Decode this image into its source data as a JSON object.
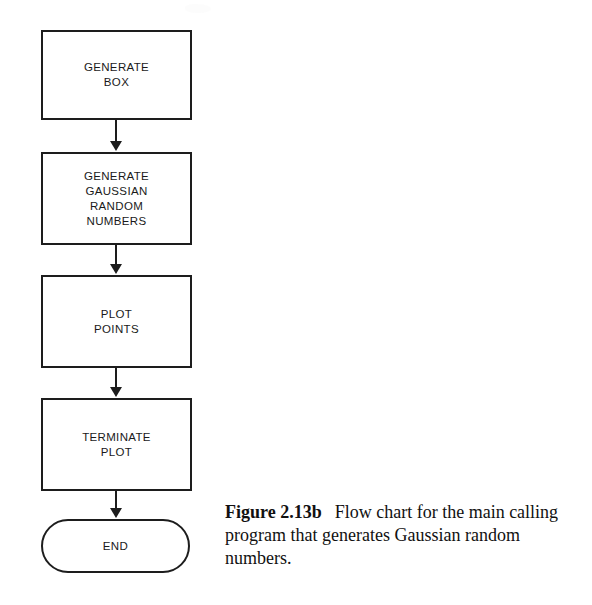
{
  "figure": {
    "caption_label": "Figure 2.13b",
    "caption_text": "Flow chart for the main calling program that generates Gaussian random numbers."
  },
  "flowchart": {
    "type": "flowchart",
    "orientation": "top-to-bottom",
    "nodes": [
      {
        "id": "generate-box",
        "shape": "process",
        "label": "GENERATE\nBOX"
      },
      {
        "id": "generate-gaussian",
        "shape": "process",
        "label": "GENERATE\nGAUSSIAN\nRANDOM\nNUMBERS"
      },
      {
        "id": "plot-points",
        "shape": "process",
        "label": "PLOT\nPOINTS"
      },
      {
        "id": "terminate-plot",
        "shape": "process",
        "label": "TERMINATE\nPLOT"
      },
      {
        "id": "end",
        "shape": "terminator",
        "label": "END"
      }
    ],
    "edges": [
      {
        "from": "generate-box",
        "to": "generate-gaussian",
        "arrow": "down"
      },
      {
        "from": "generate-gaussian",
        "to": "plot-points",
        "arrow": "down"
      },
      {
        "from": "plot-points",
        "to": "terminate-plot",
        "arrow": "down"
      },
      {
        "from": "terminate-plot",
        "to": "end",
        "arrow": "down"
      }
    ]
  },
  "style": {
    "background": "#ffffff",
    "stroke": "#1d1d1d",
    "text": "#1a1a1a"
  }
}
